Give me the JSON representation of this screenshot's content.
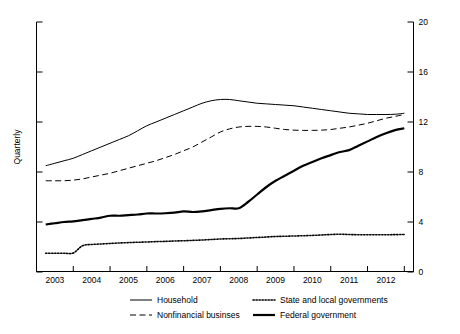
{
  "chart_data": {
    "type": "line",
    "title": "",
    "subtitle": "",
    "xlabel": "",
    "ylabel": "Quarterly",
    "xlim": [
      2002.5,
      2012.75
    ],
    "ylim": [
      0,
      20
    ],
    "yticks": [
      0,
      4,
      8,
      12,
      16,
      20
    ],
    "ytick_labels": [
      "0",
      "4",
      "8",
      "12",
      "16",
      "20"
    ],
    "y_axis_position": "right",
    "left_axis_ticks_unlabeled": true,
    "xticks": [
      2003,
      2004,
      2005,
      2006,
      2007,
      2008,
      2009,
      2010,
      2011,
      2012
    ],
    "xtick_labels": [
      "2003",
      "2004",
      "2005",
      "2006",
      "2007",
      "2008",
      "2009",
      "2010",
      "2011",
      "2012"
    ],
    "xtick_label_offset": "centered-between-ticks",
    "grid": false,
    "legend_position": "bottom",
    "legend_columns": 2,
    "series": [
      {
        "name": "Household",
        "style": "solid",
        "width": 1.0,
        "color": "#000000",
        "x": [
          2002.75,
          2003.0,
          2003.25,
          2003.5,
          2003.75,
          2004.0,
          2004.25,
          2004.5,
          2004.75,
          2005.0,
          2005.25,
          2005.5,
          2005.75,
          2006.0,
          2006.25,
          2006.5,
          2006.75,
          2007.0,
          2007.25,
          2007.5,
          2007.75,
          2008.0,
          2008.25,
          2008.5,
          2008.75,
          2009.0,
          2009.25,
          2009.5,
          2009.75,
          2010.0,
          2010.25,
          2010.5,
          2010.75,
          2011.0,
          2011.25,
          2011.5,
          2011.75,
          2012.0,
          2012.25,
          2012.5
        ],
        "y": [
          8.5,
          8.7,
          8.9,
          9.1,
          9.4,
          9.7,
          10.0,
          10.3,
          10.6,
          10.9,
          11.3,
          11.7,
          12.0,
          12.3,
          12.6,
          12.9,
          13.2,
          13.5,
          13.7,
          13.8,
          13.8,
          13.7,
          13.6,
          13.5,
          13.45,
          13.4,
          13.35,
          13.3,
          13.2,
          13.1,
          13.0,
          12.9,
          12.8,
          12.7,
          12.65,
          12.6,
          12.6,
          12.6,
          12.62,
          12.7
        ]
      },
      {
        "name": "Nonfinancial businses",
        "style": "dashed",
        "width": 1.0,
        "color": "#000000",
        "x": [
          2002.75,
          2003.0,
          2003.25,
          2003.5,
          2003.75,
          2004.0,
          2004.25,
          2004.5,
          2004.75,
          2005.0,
          2005.25,
          2005.5,
          2005.75,
          2006.0,
          2006.25,
          2006.5,
          2006.75,
          2007.0,
          2007.25,
          2007.5,
          2007.75,
          2008.0,
          2008.25,
          2008.5,
          2008.75,
          2009.0,
          2009.25,
          2009.5,
          2009.75,
          2010.0,
          2010.25,
          2010.5,
          2010.75,
          2011.0,
          2011.25,
          2011.5,
          2011.75,
          2012.0,
          2012.25,
          2012.5
        ],
        "y": [
          7.3,
          7.3,
          7.3,
          7.35,
          7.45,
          7.6,
          7.75,
          7.9,
          8.1,
          8.3,
          8.5,
          8.7,
          8.9,
          9.15,
          9.4,
          9.7,
          10.0,
          10.4,
          10.8,
          11.2,
          11.45,
          11.6,
          11.65,
          11.65,
          11.6,
          11.5,
          11.4,
          11.35,
          11.33,
          11.33,
          11.35,
          11.4,
          11.5,
          11.6,
          11.75,
          11.9,
          12.1,
          12.3,
          12.45,
          12.6
        ]
      },
      {
        "name": "State and local governments",
        "style": "dotted",
        "width": 1.6,
        "color": "#000000",
        "x": [
          2002.75,
          2003.0,
          2003.25,
          2003.5,
          2003.75,
          2004.0,
          2004.25,
          2004.5,
          2004.75,
          2005.0,
          2005.25,
          2005.5,
          2005.75,
          2006.0,
          2006.25,
          2006.5,
          2006.75,
          2007.0,
          2007.25,
          2007.5,
          2007.75,
          2008.0,
          2008.25,
          2008.5,
          2008.75,
          2009.0,
          2009.25,
          2009.5,
          2009.75,
          2010.0,
          2010.25,
          2010.5,
          2010.75,
          2011.0,
          2011.25,
          2011.5,
          2011.75,
          2012.0,
          2012.25,
          2012.5
        ],
        "y": [
          1.5,
          1.5,
          1.5,
          1.52,
          2.1,
          2.2,
          2.24,
          2.28,
          2.32,
          2.35,
          2.38,
          2.4,
          2.43,
          2.45,
          2.48,
          2.5,
          2.53,
          2.56,
          2.6,
          2.64,
          2.66,
          2.68,
          2.72,
          2.76,
          2.8,
          2.84,
          2.86,
          2.88,
          2.9,
          2.93,
          2.96,
          3.0,
          3.02,
          3.0,
          2.98,
          2.98,
          2.98,
          2.98,
          2.99,
          3.0
        ]
      },
      {
        "name": "Federal government",
        "style": "solid",
        "width": 2.2,
        "color": "#000000",
        "x": [
          2002.75,
          2003.0,
          2003.25,
          2003.5,
          2003.75,
          2004.0,
          2004.25,
          2004.5,
          2004.75,
          2005.0,
          2005.25,
          2005.5,
          2005.75,
          2006.0,
          2006.25,
          2006.5,
          2006.75,
          2007.0,
          2007.25,
          2007.5,
          2007.75,
          2008.0,
          2008.25,
          2008.5,
          2008.75,
          2009.0,
          2009.25,
          2009.5,
          2009.75,
          2010.0,
          2010.25,
          2010.5,
          2010.75,
          2011.0,
          2011.25,
          2011.5,
          2011.75,
          2012.0,
          2012.25,
          2012.5
        ],
        "y": [
          3.8,
          3.9,
          4.0,
          4.05,
          4.15,
          4.25,
          4.35,
          4.5,
          4.5,
          4.55,
          4.6,
          4.68,
          4.68,
          4.7,
          4.75,
          4.85,
          4.8,
          4.85,
          4.95,
          5.05,
          5.1,
          5.1,
          5.6,
          6.2,
          6.8,
          7.3,
          7.7,
          8.1,
          8.5,
          8.8,
          9.1,
          9.35,
          9.6,
          9.75,
          10.1,
          10.45,
          10.8,
          11.1,
          11.35,
          11.5
        ]
      }
    ]
  },
  "legend": {
    "items": [
      {
        "label": "Household",
        "style": "solid-thin"
      },
      {
        "label": "State and local governments",
        "style": "dotted"
      },
      {
        "label": "Nonfinancial businses",
        "style": "dashed"
      },
      {
        "label": "Federal government",
        "style": "solid-thick"
      }
    ]
  }
}
